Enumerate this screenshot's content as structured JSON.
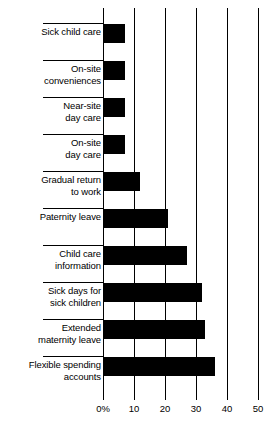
{
  "chart_data": {
    "type": "bar",
    "orientation": "horizontal",
    "title": "",
    "subtitle": "",
    "xlabel": "",
    "ylabel": "",
    "xlim": [
      0,
      50
    ],
    "grid": true,
    "legend": null,
    "tick_labels": [
      "0%",
      "10",
      "20",
      "30",
      "40",
      "50"
    ],
    "ticks": [
      0,
      10,
      20,
      30,
      40,
      50
    ],
    "categories": [
      "Sick child care",
      "On-site\nconveniences",
      "Near-site\nday care",
      "On-site\nday care",
      "Gradual return\nto work",
      "Paternity leave",
      "Child care\ninformation",
      "Sick days for\nsick children",
      "Extended\nmaternity leave",
      "Flexible spending\naccounts"
    ],
    "values": [
      7,
      7,
      7,
      7,
      12,
      21,
      27,
      32,
      33,
      36
    ],
    "bar_color": "#000000",
    "axis_color": "#000000",
    "background": "#ffffff"
  }
}
